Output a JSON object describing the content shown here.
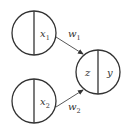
{
  "diagram": {
    "type": "neural-network-neuron",
    "colors": {
      "stroke": "#333333",
      "background": "#ffffff"
    },
    "nodes": [
      {
        "id": "x1",
        "label": "x",
        "subscript": "1",
        "left_label": "",
        "right_label": "x",
        "right_sub": "1"
      },
      {
        "id": "x2",
        "label": "x",
        "subscript": "2",
        "left_label": "",
        "right_label": "x",
        "right_sub": "2"
      },
      {
        "id": "neuron",
        "left_label": "z",
        "right_label": "y"
      }
    ],
    "edges": [
      {
        "from": "x1",
        "to": "neuron",
        "weight": "w",
        "weight_sub": "1"
      },
      {
        "from": "x2",
        "to": "neuron",
        "weight": "w",
        "weight_sub": "2"
      }
    ]
  }
}
